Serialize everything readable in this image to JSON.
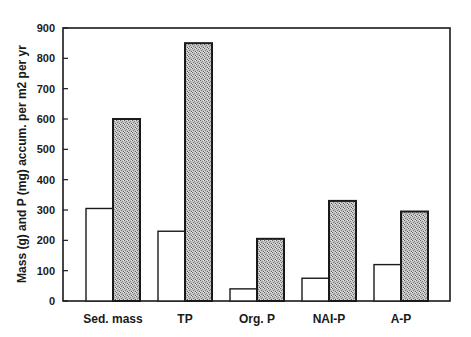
{
  "chart_data": {
    "type": "bar",
    "title": "",
    "xlabel": "",
    "ylabel": "Mass (g) and P (mg) accum. per m2 per yr",
    "categories": [
      "Sed. mass",
      "TP",
      "Org. P",
      "NAI-P",
      "A-P"
    ],
    "series": [
      {
        "name": "white (open) bars",
        "fill": "#ffffff",
        "values": [
          305,
          230,
          40,
          75,
          120
        ]
      },
      {
        "name": "stippled (grey) bars",
        "fill": "#b8b8b8",
        "values": [
          600,
          850,
          205,
          330,
          295
        ]
      }
    ],
    "ylim": [
      0,
      900
    ],
    "yticks": [
      0,
      100,
      200,
      300,
      400,
      500,
      600,
      700,
      800,
      900
    ],
    "grid": false,
    "legend": "none"
  }
}
